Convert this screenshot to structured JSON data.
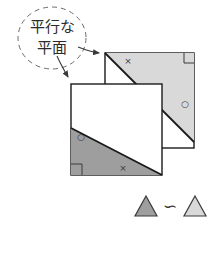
{
  "figure": {
    "title_callout": {
      "line1": "平行な",
      "line2": "平面",
      "shape": "dashed-circle",
      "arrow_count": 2
    },
    "colors": {
      "outline": "#1a1a1a",
      "light_triangle_fill": "#d9d9d9",
      "dark_triangle_fill": "#9e9e9e",
      "callout_stroke": "#6b6b6b",
      "plane_fill": "#ffffff",
      "text": "#2b2b2b"
    },
    "planes": [
      {
        "id": "upper-plane",
        "name": "上の平面",
        "triangle_position": "upper-right",
        "triangle_shade": "light",
        "marks": {
          "cross": "×",
          "circle": "○",
          "right_angle": "⌐"
        }
      },
      {
        "id": "lower-plane",
        "name": "下の平面",
        "triangle_position": "lower-left",
        "triangle_shade": "dark",
        "marks": {
          "cross": "×",
          "circle": "○",
          "right_angle": "⌐"
        }
      }
    ],
    "legend": {
      "left_triangle_shade": "dark",
      "right_triangle_shade": "light",
      "relation_symbol": "∽",
      "relation_name": "similar-to"
    }
  }
}
